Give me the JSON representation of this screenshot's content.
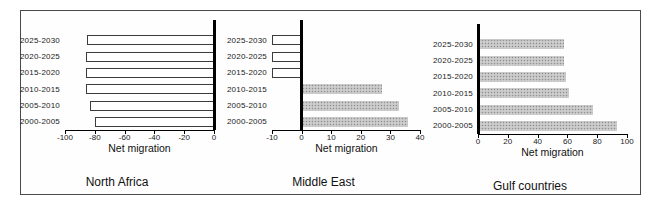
{
  "figure": {
    "name": "Net migration by region, five-year periods 2000-2030",
    "background": "#ffffff",
    "frame_border_color": "#4a4a4a"
  },
  "colors": {
    "positive_bar_fill": "#c2c2c2",
    "negative_bar_fill": "#ffffff",
    "bar_outline": "#3c3c3c",
    "axis_line": "#000000",
    "text": "#111111"
  },
  "chart_data": [
    {
      "type": "bar",
      "orientation": "horizontal",
      "title": "North Africa",
      "xlabel": "Net migration",
      "categories": [
        "2025-2030",
        "2020-2025",
        "2015-2020",
        "2010-2015",
        "2005-2010",
        "2000-2005"
      ],
      "values": [
        -85,
        -86,
        -86,
        -86,
        -83,
        -80
      ],
      "xlim": [
        -100,
        0
      ],
      "xticks": [
        -100,
        -80,
        -60,
        -40,
        -20,
        0
      ],
      "grid": false,
      "legend": "none"
    },
    {
      "type": "bar",
      "orientation": "horizontal",
      "title": "Middle East",
      "xlabel": "Net migration",
      "categories": [
        "2025-2030",
        "2020-2025",
        "2015-2020",
        "2010-2015",
        "2005-2010",
        "2000-2005"
      ],
      "values": [
        -10,
        -10,
        -10,
        27,
        33,
        36
      ],
      "xlim": [
        -10,
        40
      ],
      "xticks": [
        -10,
        0,
        10,
        20,
        30,
        40
      ],
      "grid": false,
      "legend": "none"
    },
    {
      "type": "bar",
      "orientation": "horizontal",
      "title": "Gulf countries",
      "xlabel": "Net migration",
      "categories": [
        "2025-2030",
        "2020-2025",
        "2015-2020",
        "2010-2015",
        "2005-2010",
        "2000-2005"
      ],
      "values": [
        58,
        58,
        59,
        61,
        77,
        93
      ],
      "xlim": [
        0,
        100
      ],
      "xticks": [
        0,
        20,
        40,
        60,
        80,
        100
      ],
      "grid": false,
      "legend": "none"
    }
  ]
}
